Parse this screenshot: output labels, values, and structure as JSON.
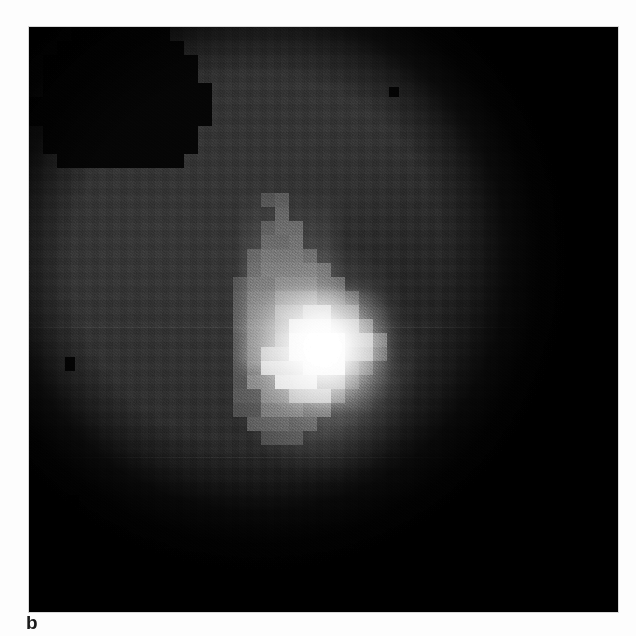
{
  "figure": {
    "panel_label": "b",
    "modality": "grayscale astronomical imaging panel",
    "background_color": "#2b2b2b",
    "dark_color": "#050505",
    "highlight_color": "#ffffff",
    "panel": {
      "left": 29,
      "top": 27,
      "width": 589,
      "height": 585
    },
    "field_of_view": "circular, stair-stepped blocky edge, dark outside",
    "features": [
      "bright saturated pixelated core slightly below and left of centre",
      "diffuse vertical plume extending upward from the core",
      "fainter extended envelope surrounding the core",
      "dark occulted wedge in the upper-left corner",
      "dark occulted region along the right side and lower-right corner",
      "horizontal detector seam lines across the frame",
      "isolated dark hot/dead pixel blocks"
    ]
  },
  "chart_data": {
    "type": "heatmap",
    "title": "",
    "xlabel": "",
    "ylabel": "",
    "colormap": "grayscale",
    "grid": false,
    "legend": null,
    "cell_size_px": 14,
    "annotations": [
      {
        "text": "b",
        "position": "below-left of panel"
      }
    ],
    "source_centroid": {
      "x": 300,
      "y": 332
    },
    "intensity_levels": {
      "background": 0.17,
      "envelope": 0.38,
      "plume": 0.3,
      "core": 1.0,
      "occulted": 0.02
    },
    "pixels": [
      {
        "x": 232,
        "y": 166,
        "w": 14,
        "h": 14,
        "v": 0.26
      },
      {
        "x": 246,
        "y": 166,
        "w": 14,
        "h": 14,
        "v": 0.3
      },
      {
        "x": 246,
        "y": 180,
        "w": 14,
        "h": 14,
        "v": 0.33
      },
      {
        "x": 232,
        "y": 194,
        "w": 14,
        "h": 14,
        "v": 0.28
      },
      {
        "x": 246,
        "y": 194,
        "w": 28,
        "h": 14,
        "v": 0.34
      },
      {
        "x": 232,
        "y": 208,
        "w": 28,
        "h": 14,
        "v": 0.32
      },
      {
        "x": 260,
        "y": 208,
        "w": 14,
        "h": 14,
        "v": 0.36
      },
      {
        "x": 218,
        "y": 222,
        "w": 14,
        "h": 14,
        "v": 0.29
      },
      {
        "x": 232,
        "y": 222,
        "w": 42,
        "h": 14,
        "v": 0.37
      },
      {
        "x": 274,
        "y": 222,
        "w": 14,
        "h": 14,
        "v": 0.31
      },
      {
        "x": 218,
        "y": 236,
        "w": 14,
        "h": 14,
        "v": 0.31
      },
      {
        "x": 232,
        "y": 236,
        "w": 56,
        "h": 14,
        "v": 0.39
      },
      {
        "x": 288,
        "y": 236,
        "w": 14,
        "h": 14,
        "v": 0.33
      },
      {
        "x": 204,
        "y": 250,
        "w": 14,
        "h": 14,
        "v": 0.27
      },
      {
        "x": 218,
        "y": 250,
        "w": 28,
        "h": 14,
        "v": 0.36
      },
      {
        "x": 246,
        "y": 250,
        "w": 42,
        "h": 14,
        "v": 0.44
      },
      {
        "x": 288,
        "y": 250,
        "w": 28,
        "h": 14,
        "v": 0.34
      },
      {
        "x": 204,
        "y": 264,
        "w": 14,
        "h": 14,
        "v": 0.3
      },
      {
        "x": 218,
        "y": 264,
        "w": 28,
        "h": 14,
        "v": 0.4
      },
      {
        "x": 246,
        "y": 264,
        "w": 42,
        "h": 14,
        "v": 0.52
      },
      {
        "x": 288,
        "y": 264,
        "w": 28,
        "h": 14,
        "v": 0.38
      },
      {
        "x": 316,
        "y": 264,
        "w": 14,
        "h": 14,
        "v": 0.28
      },
      {
        "x": 204,
        "y": 278,
        "w": 14,
        "h": 14,
        "v": 0.32
      },
      {
        "x": 218,
        "y": 278,
        "w": 28,
        "h": 14,
        "v": 0.43
      },
      {
        "x": 246,
        "y": 278,
        "w": 28,
        "h": 14,
        "v": 0.62
      },
      {
        "x": 274,
        "y": 278,
        "w": 28,
        "h": 14,
        "v": 0.78
      },
      {
        "x": 302,
        "y": 278,
        "w": 28,
        "h": 14,
        "v": 0.46
      },
      {
        "x": 204,
        "y": 292,
        "w": 14,
        "h": 14,
        "v": 0.33
      },
      {
        "x": 218,
        "y": 292,
        "w": 28,
        "h": 14,
        "v": 0.45
      },
      {
        "x": 246,
        "y": 292,
        "w": 14,
        "h": 14,
        "v": 0.58
      },
      {
        "x": 260,
        "y": 292,
        "w": 42,
        "h": 14,
        "v": 0.92
      },
      {
        "x": 302,
        "y": 292,
        "w": 28,
        "h": 14,
        "v": 0.7
      },
      {
        "x": 330,
        "y": 292,
        "w": 14,
        "h": 14,
        "v": 0.4
      },
      {
        "x": 204,
        "y": 306,
        "w": 14,
        "h": 14,
        "v": 0.31
      },
      {
        "x": 218,
        "y": 306,
        "w": 28,
        "h": 14,
        "v": 0.44
      },
      {
        "x": 246,
        "y": 306,
        "w": 14,
        "h": 14,
        "v": 0.62
      },
      {
        "x": 260,
        "y": 306,
        "w": 56,
        "h": 14,
        "v": 1.0
      },
      {
        "x": 316,
        "y": 306,
        "w": 28,
        "h": 14,
        "v": 0.72
      },
      {
        "x": 344,
        "y": 306,
        "w": 14,
        "h": 14,
        "v": 0.38
      },
      {
        "x": 204,
        "y": 320,
        "w": 14,
        "h": 14,
        "v": 0.3
      },
      {
        "x": 218,
        "y": 320,
        "w": 14,
        "h": 14,
        "v": 0.42
      },
      {
        "x": 232,
        "y": 320,
        "w": 28,
        "h": 14,
        "v": 0.74
      },
      {
        "x": 260,
        "y": 320,
        "w": 56,
        "h": 14,
        "v": 1.0
      },
      {
        "x": 316,
        "y": 320,
        "w": 28,
        "h": 14,
        "v": 0.66
      },
      {
        "x": 344,
        "y": 320,
        "w": 14,
        "h": 14,
        "v": 0.3
      },
      {
        "x": 204,
        "y": 334,
        "w": 14,
        "h": 14,
        "v": 0.29
      },
      {
        "x": 218,
        "y": 334,
        "w": 14,
        "h": 14,
        "v": 0.46
      },
      {
        "x": 232,
        "y": 334,
        "w": 42,
        "h": 14,
        "v": 0.88
      },
      {
        "x": 274,
        "y": 334,
        "w": 42,
        "h": 14,
        "v": 1.0
      },
      {
        "x": 316,
        "y": 334,
        "w": 14,
        "h": 14,
        "v": 0.4
      },
      {
        "x": 330,
        "y": 334,
        "w": 14,
        "h": 14,
        "v": 0.26
      },
      {
        "x": 204,
        "y": 348,
        "w": 14,
        "h": 14,
        "v": 0.28
      },
      {
        "x": 218,
        "y": 348,
        "w": 28,
        "h": 14,
        "v": 0.52
      },
      {
        "x": 246,
        "y": 348,
        "w": 42,
        "h": 14,
        "v": 0.94
      },
      {
        "x": 288,
        "y": 348,
        "w": 28,
        "h": 14,
        "v": 0.6
      },
      {
        "x": 316,
        "y": 348,
        "w": 14,
        "h": 14,
        "v": 0.22
      },
      {
        "x": 204,
        "y": 362,
        "w": 28,
        "h": 14,
        "v": 0.3
      },
      {
        "x": 232,
        "y": 362,
        "w": 28,
        "h": 14,
        "v": 0.52
      },
      {
        "x": 260,
        "y": 362,
        "w": 42,
        "h": 14,
        "v": 0.74
      },
      {
        "x": 302,
        "y": 362,
        "w": 14,
        "h": 14,
        "v": 0.34
      },
      {
        "x": 204,
        "y": 376,
        "w": 28,
        "h": 14,
        "v": 0.26
      },
      {
        "x": 232,
        "y": 376,
        "w": 42,
        "h": 14,
        "v": 0.44
      },
      {
        "x": 274,
        "y": 376,
        "w": 28,
        "h": 14,
        "v": 0.36
      },
      {
        "x": 218,
        "y": 390,
        "w": 42,
        "h": 14,
        "v": 0.32
      },
      {
        "x": 260,
        "y": 390,
        "w": 28,
        "h": 14,
        "v": 0.28
      },
      {
        "x": 232,
        "y": 404,
        "w": 42,
        "h": 14,
        "v": 0.24
      }
    ],
    "defects": [
      {
        "x": 100,
        "y": 96,
        "w": 12,
        "h": 12
      },
      {
        "x": 36,
        "y": 330,
        "w": 10,
        "h": 14
      },
      {
        "x": 38,
        "y": 468,
        "w": 12,
        "h": 12
      },
      {
        "x": 360,
        "y": 60,
        "w": 10,
        "h": 10
      },
      {
        "x": 150,
        "y": 556,
        "w": 20,
        "h": 16
      },
      {
        "x": 196,
        "y": 560,
        "w": 16,
        "h": 14
      },
      {
        "x": 262,
        "y": 558,
        "w": 22,
        "h": 16
      },
      {
        "x": 330,
        "y": 562,
        "w": 18,
        "h": 14
      },
      {
        "x": 398,
        "y": 556,
        "w": 20,
        "h": 16
      },
      {
        "x": 462,
        "y": 560,
        "w": 16,
        "h": 14
      }
    ],
    "seams": [
      300,
      430,
      520
    ]
  }
}
